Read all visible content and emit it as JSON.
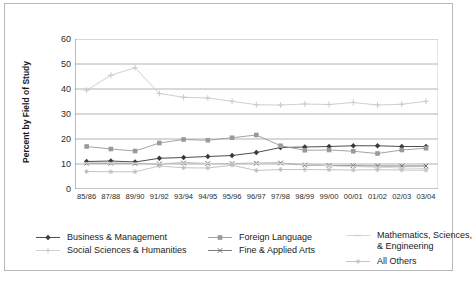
{
  "chart_data": {
    "type": "line",
    "title": "",
    "xlabel": "",
    "ylabel": "Percent by Field of Study",
    "ylim": [
      0,
      60
    ],
    "yticks": [
      0,
      10,
      20,
      30,
      40,
      50,
      60
    ],
    "grid": true,
    "legend_position": "bottom",
    "categories": [
      "85/86",
      "87/88",
      "89/90",
      "91/92",
      "93/94",
      "94/95",
      "95/96",
      "96/97",
      "97/98",
      "98/99",
      "99/00",
      "00/01",
      "01/02",
      "02/03",
      "03/04"
    ],
    "series": [
      {
        "name": "Business & Management",
        "color": "#3a3a3a",
        "marker": "diamond",
        "values": [
          11.0,
          11.2,
          10.8,
          12.3,
          12.6,
          13.0,
          13.4,
          14.6,
          16.6,
          16.8,
          17.0,
          17.3,
          17.3,
          17.0,
          17.0
        ]
      },
      {
        "name": "Social Sciences & Humanities",
        "color": "#c9c9c9",
        "marker": "cross",
        "values": [
          39.5,
          45.5,
          48.5,
          38.2,
          36.7,
          36.4,
          35.1,
          33.7,
          33.6,
          34.0,
          33.8,
          34.6,
          33.6,
          33.9,
          35.1
        ]
      },
      {
        "name": "Foreign Language",
        "color": "#9a9a9a",
        "marker": "square",
        "values": [
          17.0,
          16.0,
          15.2,
          18.4,
          19.8,
          19.5,
          20.5,
          21.6,
          17.3,
          15.5,
          15.6,
          15.1,
          14.2,
          15.6,
          16.3
        ]
      },
      {
        "name": "Fine & Applied Arts",
        "color": "#6e6e6e",
        "marker": "x",
        "values": [
          10.3,
          10.3,
          10.2,
          10.1,
          10.4,
          10.2,
          10.2,
          10.3,
          10.4,
          9.6,
          9.4,
          9.3,
          9.2,
          9.2,
          9.2
        ]
      },
      {
        "name": "Mathematics, Sciences, & Engineering",
        "color": "#d2d2d2",
        "marker": "dash",
        "values": [
          10.4,
          10.4,
          10.3,
          10.2,
          10.3,
          10.2,
          10.1,
          10.2,
          10.2,
          9.8,
          9.3,
          9.0,
          8.7,
          8.4,
          8.2
        ]
      },
      {
        "name": "All Others",
        "color": "#bdbdbd",
        "marker": "star",
        "values": [
          7.0,
          6.9,
          6.9,
          9.2,
          8.5,
          8.4,
          9.5,
          7.4,
          7.8,
          7.8,
          7.7,
          7.6,
          7.7,
          7.6,
          7.5
        ]
      }
    ]
  },
  "legend": {
    "items": [
      {
        "label": "Business & Management"
      },
      {
        "label": "Foreign Language"
      },
      {
        "label": "Mathematics, Sciences,"
      },
      {
        "label": "Social Sciences & Humanities"
      },
      {
        "label": "Fine & Applied Arts"
      },
      {
        "label": "& Engineering"
      },
      {
        "label": "All Others"
      }
    ]
  },
  "footnote": {
    "text": ""
  }
}
